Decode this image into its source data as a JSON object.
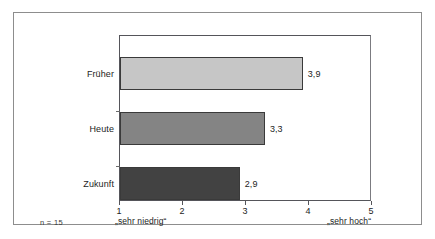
{
  "chart_data": {
    "type": "bar",
    "orientation": "horizontal",
    "title": "",
    "subtitle": "",
    "xlabel": "",
    "ylabel": "",
    "categories": [
      "Früher",
      "Heute",
      "Zukunft"
    ],
    "values": [
      3.9,
      3.3,
      2.9
    ],
    "value_labels": [
      "3,9",
      "3,3",
      "2,9"
    ],
    "series": [
      {
        "name": "Mittelwert",
        "values": [
          3.9,
          3.3,
          2.9
        ]
      }
    ],
    "bars": [
      {
        "category": "Früher",
        "value": 3.9,
        "label": "3,9",
        "color": "#c6c6c6"
      },
      {
        "category": "Heute",
        "value": 3.3,
        "label": "3,3",
        "color": "#848484"
      },
      {
        "category": "Zukunft",
        "value": 2.9,
        "label": "2,9",
        "color": "#424242"
      }
    ],
    "xlim": [
      1,
      5
    ],
    "xticks": [
      1,
      2,
      3,
      4,
      5
    ],
    "xtick_labels": [
      "1",
      "2",
      "3",
      "4",
      "5"
    ],
    "grid": false,
    "legend": false,
    "legend_position": "none",
    "scale_anchor_low": "„sehr niedrig“",
    "scale_anchor_high": "„sehr hoch“",
    "annotations": {
      "sample_size": "n = 15"
    }
  },
  "figure": {
    "frame_color": "#8d8d8d",
    "axis_color": "#55555a",
    "background": "#ffffff"
  }
}
